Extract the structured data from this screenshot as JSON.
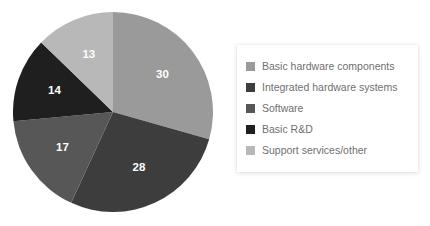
{
  "chart_data": {
    "type": "pie",
    "title": "",
    "subtitle": "",
    "categories": [
      "Basic hardware components",
      "Integrated hardware systems",
      "Software",
      "Basic R&D",
      "Support services/other"
    ],
    "values": [
      30,
      28,
      17,
      14,
      13
    ],
    "data_labels": [
      "30",
      "28",
      "17",
      "14",
      "13"
    ],
    "colors": [
      "#9a9a9a",
      "#3d3d3d",
      "#575757",
      "#1f1f1f",
      "#b8b8b8"
    ],
    "start_angle_deg": 0,
    "direction": "clockwise",
    "legend": {
      "position": "right",
      "entries": [
        {
          "label": "Basic hardware components",
          "color": "#9a9a9a"
        },
        {
          "label": "Integrated hardware systems",
          "color": "#3d3d3d"
        },
        {
          "label": "Software",
          "color": "#575757"
        },
        {
          "label": "Basic R&D",
          "color": "#1f1f1f"
        },
        {
          "label": "Support services/other",
          "color": "#b8b8b8"
        }
      ]
    },
    "xlabel": "",
    "ylabel": "",
    "grid": false,
    "background": "#ffffff",
    "label_color": "#ffffff"
  }
}
